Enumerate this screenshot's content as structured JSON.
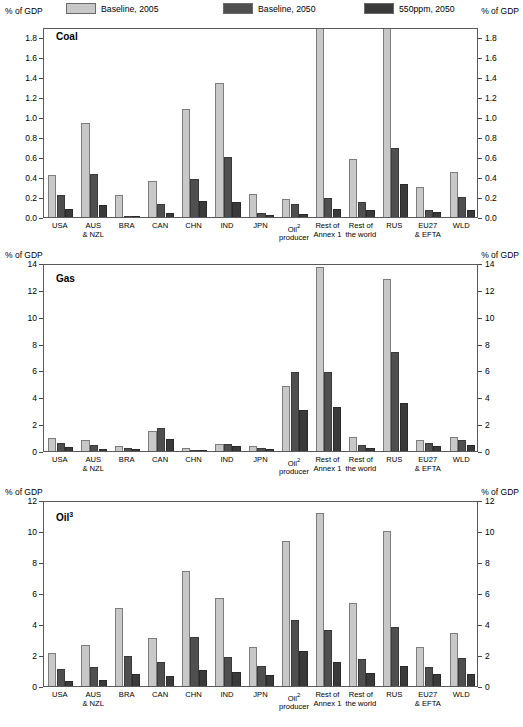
{
  "legend": {
    "axis_label_left": "% of GDP",
    "axis_label_right": "% of GDP",
    "items": [
      {
        "label": "Baseline, 2005",
        "color": "#c8c8c8"
      },
      {
        "label": "Baseline, 2050",
        "color": "#4f4f4f"
      },
      {
        "label": "550ppm, 2050",
        "color": "#3a3a3a"
      }
    ]
  },
  "axis_unit_label": "% of GDP",
  "categories": [
    "USA",
    "AUS\n& NZL",
    "BRA",
    "CAN",
    "CHN",
    "IND",
    "JPN",
    "Oil²\nproducer",
    "Rest of\nAnnex 1",
    "Rest of\nthe world",
    "RUS",
    "EU27\n& EFTA",
    "WLD"
  ],
  "chart_data": [
    {
      "type": "bar",
      "title": "Coal",
      "xlabel": "",
      "ylabel": "% of GDP",
      "ylim": [
        0.0,
        1.9
      ],
      "yticks": [
        0.0,
        0.2,
        0.4,
        0.6,
        0.8,
        1.0,
        1.2,
        1.4,
        1.6,
        1.8
      ],
      "ytick_labels": [
        "0.0",
        "0.2",
        "0.4",
        "0.6",
        "0.8",
        "1.0",
        "1.2",
        "1.4",
        "1.6",
        "1.8"
      ],
      "grid": false,
      "legend_position": "top",
      "categories": [
        "USA",
        "AUS & NZL",
        "BRA",
        "CAN",
        "CHN",
        "IND",
        "JPN",
        "Oil producer",
        "Rest of Annex 1",
        "Rest of the world",
        "RUS",
        "EU27 & EFTA",
        "WLD"
      ],
      "series": [
        {
          "name": "Baseline, 2005",
          "values": [
            0.42,
            0.94,
            0.22,
            0.36,
            1.08,
            1.34,
            0.23,
            0.18,
            2.4,
            0.58,
            1.9,
            0.3,
            0.45
          ]
        },
        {
          "name": "Baseline, 2050",
          "values": [
            0.22,
            0.43,
            0.01,
            0.13,
            0.38,
            0.6,
            0.04,
            0.13,
            0.19,
            0.15,
            0.69,
            0.07,
            0.2
          ]
        },
        {
          "name": "550ppm, 2050",
          "values": [
            0.08,
            0.12,
            0.01,
            0.04,
            0.16,
            0.15,
            0.02,
            0.03,
            0.08,
            0.07,
            0.33,
            0.05,
            0.07
          ]
        }
      ],
      "notes": "Rest of Annex 1 Baseline 2005 bar exceeds the plotted axis maximum and is clipped."
    },
    {
      "type": "bar",
      "title": "Gas",
      "xlabel": "",
      "ylabel": "% of GDP",
      "ylim": [
        0,
        14
      ],
      "yticks": [
        0,
        2,
        4,
        6,
        8,
        10,
        12,
        14
      ],
      "ytick_labels": [
        "0",
        "2",
        "4",
        "6",
        "8",
        "10",
        "12",
        "14"
      ],
      "grid": false,
      "legend_position": "top",
      "categories": [
        "USA",
        "AUS & NZL",
        "BRA",
        "CAN",
        "CHN",
        "IND",
        "JPN",
        "Oil producer",
        "Rest of Annex 1",
        "Rest of the world",
        "RUS",
        "EU27 & EFTA",
        "WLD"
      ],
      "series": [
        {
          "name": "Baseline, 2005",
          "values": [
            0.95,
            0.85,
            0.35,
            1.5,
            0.22,
            0.55,
            0.35,
            4.85,
            13.7,
            1.05,
            12.8,
            0.8,
            1.05
          ]
        },
        {
          "name": "Baseline, 2050",
          "values": [
            0.6,
            0.45,
            0.2,
            1.7,
            0.08,
            0.55,
            0.25,
            5.85,
            5.85,
            0.45,
            7.35,
            0.6,
            0.85
          ]
        },
        {
          "name": "550ppm, 2050",
          "values": [
            0.3,
            0.12,
            0.15,
            0.9,
            0.05,
            0.38,
            0.15,
            3.05,
            3.3,
            0.25,
            3.55,
            0.35,
            0.45
          ]
        }
      ]
    },
    {
      "type": "bar",
      "title": "Oil³",
      "xlabel": "",
      "ylabel": "% of GDP",
      "ylim": [
        0,
        12
      ],
      "yticks": [
        0,
        2,
        4,
        6,
        8,
        10,
        12
      ],
      "ytick_labels": [
        "0",
        "2",
        "4",
        "6",
        "8",
        "10",
        "12"
      ],
      "grid": false,
      "legend_position": "top",
      "categories": [
        "USA",
        "AUS & NZL",
        "BRA",
        "CAN",
        "CHN",
        "IND",
        "JPN",
        "Oil producer",
        "Rest of Annex 1",
        "Rest of the world",
        "RUS",
        "EU27 & EFTA",
        "WLD"
      ],
      "series": [
        {
          "name": "Baseline, 2005",
          "values": [
            2.1,
            2.65,
            5.05,
            3.1,
            7.4,
            5.7,
            2.5,
            9.35,
            11.15,
            5.35,
            10.0,
            2.5,
            3.4
          ]
        },
        {
          "name": "Baseline, 2050",
          "values": [
            1.1,
            1.25,
            1.95,
            1.55,
            3.15,
            1.85,
            1.3,
            4.25,
            3.6,
            1.75,
            3.8,
            1.2,
            1.8
          ]
        },
        {
          "name": "550ppm, 2050",
          "values": [
            0.35,
            0.4,
            0.8,
            0.65,
            1.05,
            0.9,
            0.7,
            2.25,
            1.55,
            0.85,
            1.3,
            0.75,
            0.75
          ]
        }
      ]
    }
  ]
}
